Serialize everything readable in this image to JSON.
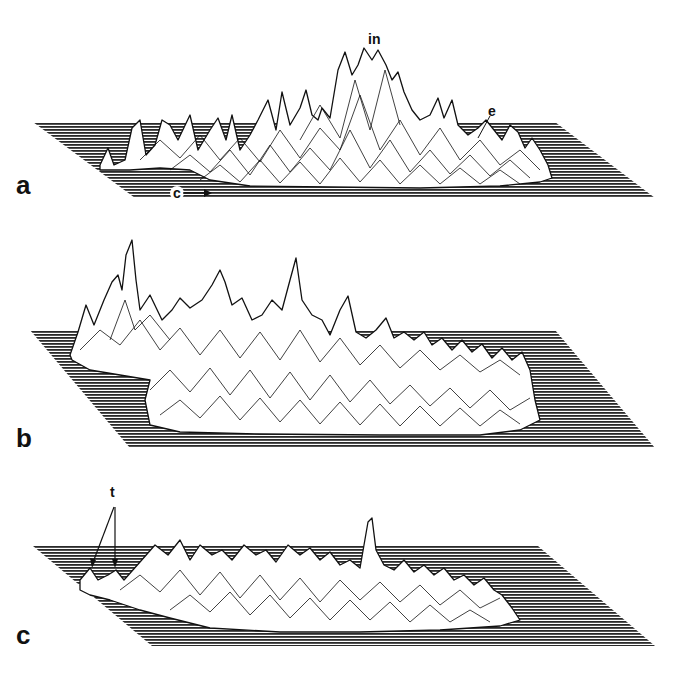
{
  "figure": {
    "panels": [
      {
        "label": "a",
        "annotations": [
          {
            "text": "in",
            "x": 368,
            "y": 38
          },
          {
            "text": "e",
            "x": 488,
            "y": 108
          },
          {
            "text": "c",
            "x": 167,
            "y": 187
          }
        ]
      },
      {
        "label": "b",
        "annotations": []
      },
      {
        "label": "c",
        "annotations": [
          {
            "text": "t",
            "x": 110,
            "y": 485
          }
        ]
      }
    ],
    "colors": {
      "background": "#ffffff",
      "ink": "#111111",
      "hatch": "#2a2a2a"
    }
  }
}
